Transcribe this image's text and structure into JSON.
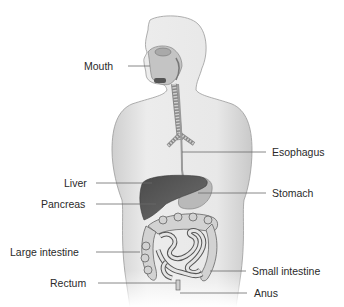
{
  "diagram": {
    "colors": {
      "skin": "#e6e6e6",
      "skin_edge": "#9a9a9a",
      "liver": "#5e5e5e",
      "stomach": "#b9b9b9",
      "intestine": "#d2d2d2",
      "intestine_edge": "#555555",
      "leader_line": "#6b6b6b",
      "label_text": "#2a2a2a"
    },
    "labels": {
      "mouth": "Mouth",
      "esophagus": "Esophagus",
      "liver": "Liver",
      "stomach": "Stomach",
      "pancreas": "Pancreas",
      "large_intestine": "Large intestine",
      "small_intestine": "Small intestine",
      "rectum": "Rectum",
      "anus": "Anus"
    }
  }
}
